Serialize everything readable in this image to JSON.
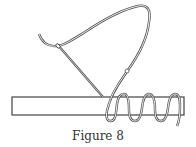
{
  "figure": {
    "caption": "Figure 8",
    "colors": {
      "line": "#555555",
      "thread_fill": "#ffffff",
      "background": "#ffffff"
    }
  }
}
